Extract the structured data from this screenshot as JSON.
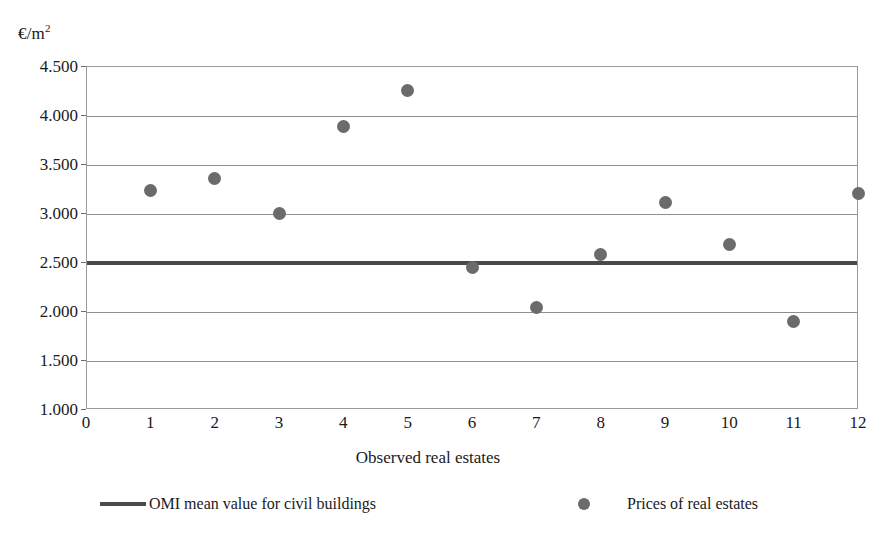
{
  "chart_data": {
    "type": "scatter",
    "title": "",
    "xlabel": "Observed real estates",
    "ylabel": "€/m²",
    "ylabel_text": "€/m",
    "ylabel_sup": "2",
    "xlim": [
      0,
      12
    ],
    "ylim": [
      1000,
      4500
    ],
    "grid": true,
    "legend_position": "bottom",
    "x_ticks": [
      "0",
      "1",
      "2",
      "3",
      "4",
      "5",
      "6",
      "7",
      "8",
      "9",
      "10",
      "11",
      "12"
    ],
    "x_tick_values": [
      0,
      1,
      2,
      3,
      4,
      5,
      6,
      7,
      8,
      9,
      10,
      11,
      12
    ],
    "y_ticks": [
      "1.000",
      "1.500",
      "2.000",
      "2.500",
      "3.000",
      "3.500",
      "4.000",
      "4.500"
    ],
    "y_tick_values": [
      1000,
      1500,
      2000,
      2500,
      3000,
      3500,
      4000,
      4500
    ],
    "series": [
      {
        "name": "Prices of real estates",
        "type": "scatter",
        "marker": "circle",
        "color": "#6b6b6b",
        "x": [
          1,
          2,
          3,
          4,
          5,
          6,
          7,
          8,
          9,
          10,
          11,
          12
        ],
        "values": [
          3230,
          3355,
          2990,
          3880,
          4255,
          2440,
          2040,
          2580,
          3110,
          2675,
          1890,
          3200
        ]
      },
      {
        "name": "OMI mean value for civil buildings",
        "type": "hline",
        "color": "#4a4a4a",
        "value": 2500
      }
    ]
  },
  "legend": {
    "entries": [
      {
        "label": "OMI mean value for civil buildings",
        "marker": "line-swatch",
        "color": "#4a4a4a"
      },
      {
        "label": "Prices of real estates",
        "marker": "dot-swatch",
        "color": "#6b6b6b"
      }
    ]
  },
  "colors": {
    "background": "#ffffff",
    "gridline": "#8f8f8f",
    "frame": "#9a9a9a",
    "omi_line": "#4a4a4a",
    "marker": "#6b6b6b",
    "text": "#1a1a1a"
  }
}
